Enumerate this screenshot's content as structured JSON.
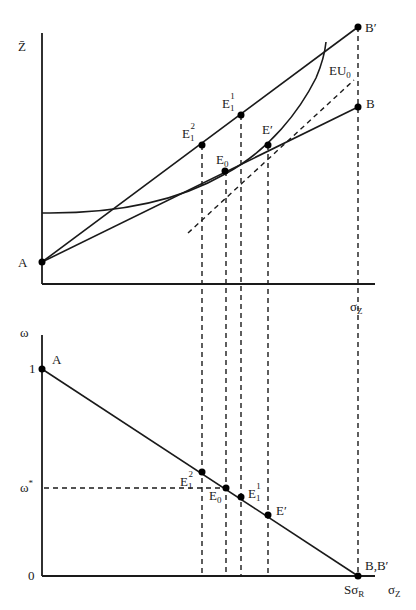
{
  "diagram": {
    "top_panel": {
      "y_axis_label": "Z̄",
      "x_axis_label": "σ",
      "x_axis_label_sub": "Z",
      "curve_label": "EU",
      "curve_label_sub": "0",
      "points": {
        "A": "A",
        "B": "B",
        "B_prime": "B′",
        "E0": "E",
        "E0_sub": "0",
        "E1_1": "E",
        "E1_1_sub": "1",
        "E1_1_sup": "1",
        "E1_2": "E",
        "E1_2_sub": "1",
        "E1_2_sup": "2",
        "E_prime": "E′"
      }
    },
    "bottom_panel": {
      "y_axis_label": "ω",
      "x_axis_label": "σ",
      "x_axis_label_sub": "Z",
      "y_tick_1": "1",
      "y_tick_0": "0",
      "y_tick_omega_star": "ω",
      "y_tick_omega_star_sup": "*",
      "x_tick_end": "Sσ",
      "x_tick_end_sub": "R",
      "points": {
        "A": "A",
        "BB_prime": "B,B′",
        "E0": "E",
        "E0_sub": "0",
        "E1_1": "E",
        "E1_1_sub": "1",
        "E1_1_sup": "1",
        "E1_2": "E",
        "E1_2_sub": "1",
        "E1_2_sup": "2",
        "E_prime": "E′"
      }
    },
    "colors": {
      "line": "#1a1a1a",
      "background": "#ffffff"
    }
  }
}
